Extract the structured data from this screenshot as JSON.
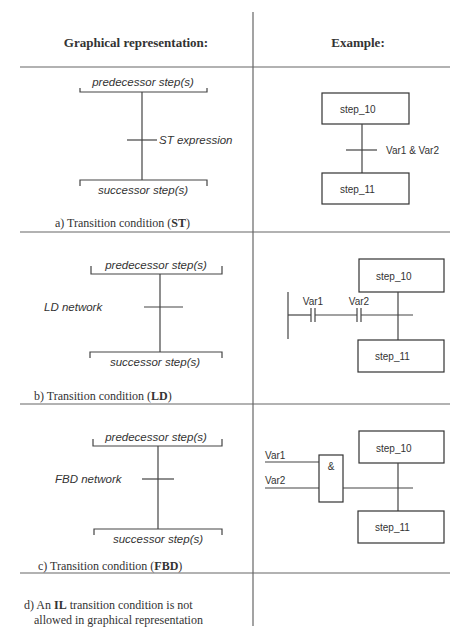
{
  "header": {
    "left": "Graphical representation:",
    "right": "Example:"
  },
  "sections": [
    {
      "id": "a",
      "caption_prefix": "a) Transition condition (",
      "caption_bold": "ST",
      "caption_suffix": ")",
      "predecessor": "predecessor step(s)",
      "successor": "successor step(s)",
      "condition_label": "ST expression",
      "example": {
        "step_top": "step_10",
        "step_bottom": "step_11",
        "condition": "Var1 & Var2"
      }
    },
    {
      "id": "b",
      "caption_prefix": "b) Transition condition (",
      "caption_bold": "LD",
      "caption_suffix": ")",
      "predecessor": "predecessor step(s)",
      "successor": "successor step(s)",
      "condition_label": "LD network",
      "example": {
        "step_top": "step_10",
        "step_bottom": "step_11",
        "contact1": "Var1",
        "contact2": "Var2"
      }
    },
    {
      "id": "c",
      "caption_prefix": "c) Transition condition (",
      "caption_bold": "FBD",
      "caption_suffix": ")",
      "predecessor": "predecessor step(s)",
      "successor": "successor step(s)",
      "condition_label": "FBD network",
      "example": {
        "step_top": "step_10",
        "step_bottom": "step_11",
        "input1": "Var1",
        "input2": "Var2",
        "block_label": "&"
      }
    },
    {
      "id": "d",
      "line1_prefix": "d) An ",
      "line1_bold": "IL",
      "line1_suffix": " transition condition is not",
      "line2": "allowed in graphical representation"
    }
  ]
}
